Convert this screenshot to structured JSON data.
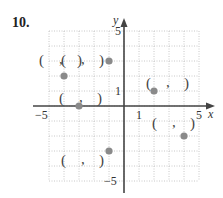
{
  "problem": {
    "number": "10."
  },
  "axes": {
    "x_label": "x",
    "y_label": "y",
    "x_ticks": [
      {
        "value": -5,
        "label": "−5"
      },
      {
        "value": 1,
        "label": "1"
      },
      {
        "value": 5,
        "label": "5"
      }
    ],
    "y_ticks": [
      {
        "value": 5,
        "label": "5"
      },
      {
        "value": 1,
        "label": "1"
      },
      {
        "value": -5,
        "label": "−5"
      }
    ],
    "xlim": [
      -5,
      5
    ],
    "ylim": [
      -5,
      5
    ]
  },
  "colors": {
    "point": "#8a8a8a",
    "axis": "#444444",
    "grid": "#c8c8c8"
  },
  "chart_data": {
    "type": "scatter",
    "title": "10.",
    "xlabel": "x",
    "ylabel": "y",
    "xlim": [
      -5,
      5
    ],
    "ylim": [
      -5,
      5
    ],
    "grid": true,
    "points": [
      {
        "x": -4,
        "y": 2,
        "blank_label": "( , )"
      },
      {
        "x": -1,
        "y": 3,
        "blank_label": "( , )"
      },
      {
        "x": -3,
        "y": 0,
        "blank_label": "( , )"
      },
      {
        "x": 2,
        "y": 1,
        "blank_label": "( , )"
      },
      {
        "x": 4,
        "y": -2,
        "blank_label": "( , )"
      },
      {
        "x": -1,
        "y": -3,
        "blank_label": "( , )"
      }
    ]
  }
}
